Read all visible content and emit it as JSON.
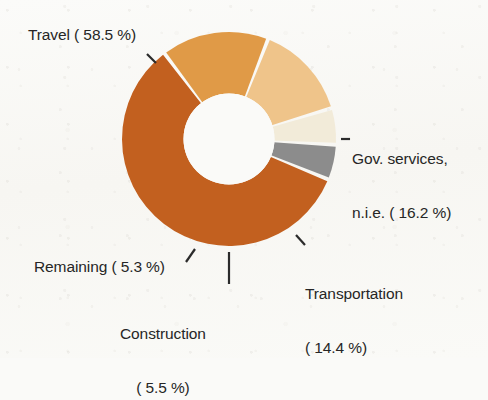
{
  "chart_data": {
    "type": "pie",
    "variant": "donut",
    "title": "",
    "subtitle": "",
    "xlabel": "",
    "ylabel": "",
    "legend_position": "none",
    "grid": false,
    "value_unit": "%",
    "total": 99.9,
    "categories": [
      "Travel",
      "Gov. services, n.i.e.",
      "Transportation",
      "Construction",
      "Remaining"
    ],
    "values": [
      58.5,
      16.2,
      14.4,
      5.5,
      5.3
    ],
    "colors": [
      "#c2601f",
      "#e09a47",
      "#efc48a",
      "#f2ebd9",
      "#8c8c8c"
    ],
    "slices": [
      {
        "name": "Travel",
        "value": 58.5,
        "label": "Travel ( 58.5 %)",
        "color": "#c2601f"
      },
      {
        "name": "Gov. services, n.i.e.",
        "value": 16.2,
        "label": "Gov. services,\nn.i.e. ( 16.2 %)",
        "color": "#e09a47"
      },
      {
        "name": "Transportation",
        "value": 14.4,
        "label": "Transportation\n( 14.4 %)",
        "color": "#efc48a"
      },
      {
        "name": "Construction",
        "value": 5.5,
        "label": "Construction\n( 5.5 %)",
        "color": "#f2ebd9"
      },
      {
        "name": "Remaining",
        "value": 5.3,
        "label": "Remaining ( 5.3 %)",
        "color": "#8c8c8c"
      }
    ]
  },
  "labels": {
    "travel": "Travel ( 58.5 %)",
    "gov_line1": "Gov. services,",
    "gov_line2": "n.i.e. ( 16.2 %)",
    "transport_line1": "Transportation",
    "transport_line2": "( 14.4 %)",
    "remaining": "Remaining ( 5.3 %)",
    "construction_line1": "Construction",
    "construction_line2": "( 5.5 %)"
  },
  "style": {
    "background": "#fafaf8",
    "text_color": "#262626",
    "leader_color": "#2b2b2b",
    "hole_color": "#fafaf8"
  }
}
